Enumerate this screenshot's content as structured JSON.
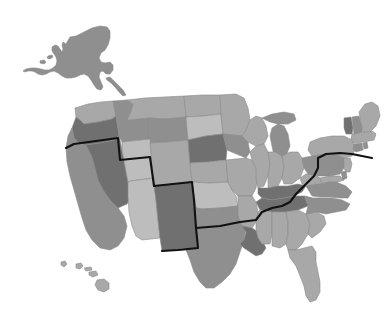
{
  "figure": {
    "type": "map",
    "title": "",
    "subtitle": "",
    "background_color": "#ffffff",
    "projection_note": "Albers USA with Alaska inset upper-left and Hawaii inset lower-left",
    "state_border_color": "#8a8a8a",
    "region_divider_color": "#111111",
    "region_divider_label": ""
  },
  "legend": {
    "visible": false,
    "position": "none",
    "entries": []
  },
  "palette": {
    "level_1": "#cfcfcf",
    "level_2": "#bdbdbd",
    "level_3": "#a8a8a8",
    "level_4": "#8f8f8f",
    "level_5": "#707070",
    "water": "#ffffff"
  },
  "chart_data": {
    "type": "heatmap",
    "title": "",
    "subtitle": "",
    "xlabel": "",
    "ylabel": "",
    "legend_position": "none",
    "grid": false,
    "value_scale": "grayscale",
    "value_levels": [
      1,
      2,
      3,
      4,
      5
    ],
    "level_colors": [
      "#cfcfcf",
      "#bdbdbd",
      "#a8a8a8",
      "#8f8f8f",
      "#707070"
    ],
    "categories": [
      "Alaska",
      "Hawaii",
      "Washington",
      "Oregon",
      "California",
      "Nevada",
      "Idaho",
      "Montana",
      "Wyoming",
      "Utah",
      "Colorado",
      "Arizona",
      "New Mexico",
      "North Dakota",
      "South Dakota",
      "Nebraska",
      "Kansas",
      "Oklahoma",
      "Texas",
      "Minnesota",
      "Iowa",
      "Missouri",
      "Arkansas",
      "Louisiana",
      "Wisconsin",
      "Illinois",
      "Michigan",
      "Indiana",
      "Ohio",
      "Kentucky",
      "Tennessee",
      "Mississippi",
      "Alabama",
      "Georgia",
      "Florida",
      "South Carolina",
      "North Carolina",
      "Virginia",
      "West Virginia",
      "Maryland",
      "Delaware",
      "Pennsylvania",
      "New Jersey",
      "New York",
      "Connecticut",
      "Rhode Island",
      "Massachusetts",
      "Vermont",
      "New Hampshire",
      "Maine"
    ],
    "values": [
      4,
      3,
      3,
      5,
      4,
      5,
      4,
      3,
      4,
      2,
      3,
      2,
      5,
      3,
      2,
      5,
      3,
      2,
      4,
      3,
      4,
      3,
      3,
      5,
      3,
      3,
      4,
      3,
      3,
      5,
      5,
      3,
      3,
      3,
      3,
      3,
      4,
      4,
      3,
      3,
      4,
      4,
      3,
      3,
      4,
      4,
      3,
      5,
      4,
      3
    ]
  },
  "states": [
    {
      "name": "Alaska",
      "abbr": "AK",
      "value": 4,
      "color": "#8f8f8f",
      "d": "M66 44 L70 37 L76 36 L84 32 L92 28 L100 26 L107 27 L110 31 L110 38 L108 45 L105 50 L101 53 L99 58 L101 62 L105 63 L110 62 L113 65 L113 70 L110 74 L106 74 L103 71 L100 72 L99 77 L101 82 L103 87 L101 90 L97 89 L94 85 L91 80 L88 76 L84 74 L80 75 L76 77 L71 78 L66 78 L62 76 L58 73 L54 71 L50 72 L46 74 L42 75 L38 74 L35 72 L32 71 L28 71 L25 72 L23 71 L26 69 L31 68 L36 68 L41 69 L45 70 L49 70 L53 68 L56 65 L57 61 L56 57 L54 54 L52 51 L52 47 L55 45 L58 46 L60 49 L62 52 L63 49 L62 45 L63 42 Z"
    },
    {
      "name": "Alaska-islet-1",
      "abbr": "AK",
      "value": 4,
      "color": "#8f8f8f",
      "d": "M40 61 L44 60 L46 62 L44 64 L40 63 Z"
    },
    {
      "name": "Alaska-islet-2",
      "abbr": "AK",
      "value": 4,
      "color": "#8f8f8f",
      "d": "M48 56 L52 55 L53 57 L50 59 L47 58 Z"
    },
    {
      "name": "Alaska-islet-3",
      "abbr": "AK",
      "value": 4,
      "color": "#8f8f8f",
      "d": "M55 51 L59 50 L61 52 L58 54 L55 53 Z"
    },
    {
      "name": "Alaska-tail",
      "abbr": "AK",
      "value": 4,
      "color": "#8f8f8f",
      "d": "M106 78 L110 77 L114 81 L119 86 L123 90 L126 95 L123 96 L119 92 L115 87 L111 83 L107 80 Z"
    },
    {
      "name": "Hawaii-kauai",
      "abbr": "HI",
      "value": 3,
      "color": "#a8a8a8",
      "d": "M61 262 L65 261 L67 264 L64 267 L61 265 Z"
    },
    {
      "name": "Hawaii-oahu",
      "abbr": "HI",
      "value": 3,
      "color": "#a8a8a8",
      "d": "M76 264 L81 263 L83 266 L80 269 L76 268 Z"
    },
    {
      "name": "Hawaii-molokai",
      "abbr": "HI",
      "value": 3,
      "color": "#a8a8a8",
      "d": "M84 268 L91 267 L92 270 L86 271 Z"
    },
    {
      "name": "Hawaii-maui",
      "abbr": "HI",
      "value": 3,
      "color": "#a8a8a8",
      "d": "M89 272 L96 271 L98 275 L93 277 L89 275 Z"
    },
    {
      "name": "Hawaii-bigisland",
      "abbr": "HI",
      "value": 3,
      "color": "#a8a8a8",
      "d": "M97 280 L104 279 L109 283 L109 289 L104 292 L98 290 L95 285 Z"
    },
    {
      "name": "Washington",
      "abbr": "WA",
      "value": 3,
      "color": "#a8a8a8",
      "d": "M75 108 L88 104 L101 102 L113 101 L116 116 L112 119 L98 122 L84 124 L80 120 L76 117 Z"
    },
    {
      "name": "Oregon",
      "abbr": "OR",
      "value": 5,
      "color": "#707070",
      "d": "M76 117 L80 120 L84 124 L98 122 L112 119 L116 116 L119 135 L115 140 L100 143 L86 145 L80 144 L74 138 L72 128 Z"
    },
    {
      "name": "California",
      "abbr": "CA",
      "value": 4,
      "color": "#8f8f8f",
      "d": "M72 128 L74 138 L80 144 L86 145 L92 157 L95 168 L98 180 L103 190 L110 200 L118 208 L124 216 L127 226 L124 238 L118 246 L110 250 L100 248 L92 240 L86 230 L82 218 L78 204 L74 190 L70 176 L67 162 L66 148 L68 136 Z"
    },
    {
      "name": "Nevada",
      "abbr": "NV",
      "value": 5,
      "color": "#707070",
      "d": "M86 145 L100 143 L115 140 L119 135 L122 150 L125 166 L128 182 L131 197 L127 204 L118 208 L110 200 L103 190 L98 180 L95 168 L92 157 Z"
    },
    {
      "name": "Idaho",
      "abbr": "ID",
      "value": 4,
      "color": "#8f8f8f",
      "d": "M113 101 L127 100 L133 104 L131 112 L127 120 L124 130 L122 140 L119 135 L116 116 Z"
    },
    {
      "name": "Idaho-south",
      "abbr": "ID",
      "value": 4,
      "color": "#8f8f8f",
      "d": "M119 135 L122 140 L124 130 L127 120 L148 118 L150 139 L122 142 Z"
    },
    {
      "name": "Montana",
      "abbr": "MT",
      "value": 3,
      "color": "#a8a8a8",
      "d": "M127 100 L145 98 L164 97 L184 96 L186 117 L166 119 L148 118 L127 120 L131 112 L133 104 Z"
    },
    {
      "name": "Wyoming",
      "abbr": "WY",
      "value": 4,
      "color": "#8f8f8f",
      "d": "M148 118 L166 119 L186 117 L188 140 L168 142 L150 143 L148 137 Z"
    },
    {
      "name": "Utah",
      "abbr": "UT",
      "value": 2,
      "color": "#bdbdbd",
      "d": "M122 142 L150 139 L152 160 L154 178 L138 180 L131 181 L128 182 L125 166 L122 150 Z"
    },
    {
      "name": "Colorado",
      "abbr": "CO",
      "value": 3,
      "color": "#a8a8a8",
      "d": "M150 143 L168 142 L188 140 L190 163 L192 182 L172 184 L154 186 L152 164 Z"
    },
    {
      "name": "Arizona",
      "abbr": "AZ",
      "value": 2,
      "color": "#bdbdbd",
      "d": "M128 182 L131 181 L138 180 L154 178 L156 200 L158 220 L160 238 L142 240 L136 236 L132 226 L129 212 L128 197 Z"
    },
    {
      "name": "New Mexico",
      "abbr": "NM",
      "value": 5,
      "color": "#707070",
      "d": "M154 186 L172 184 L192 182 L194 206 L196 228 L198 248 L178 250 L162 251 L160 238 L158 220 L156 200 Z"
    },
    {
      "name": "North Dakota",
      "abbr": "ND",
      "value": 3,
      "color": "#a8a8a8",
      "d": "M184 96 L202 95 L220 95 L221 114 L203 116 L186 117 Z"
    },
    {
      "name": "South Dakota",
      "abbr": "SD",
      "value": 2,
      "color": "#bdbdbd",
      "d": "M186 117 L203 116 L221 114 L223 134 L206 136 L188 140 Z"
    },
    {
      "name": "Nebraska",
      "abbr": "NE",
      "value": 5,
      "color": "#707070",
      "d": "M188 140 L206 136 L223 134 L227 150 L226 160 L208 162 L190 163 Z"
    },
    {
      "name": "Kansas",
      "abbr": "KS",
      "value": 3,
      "color": "#a8a8a8",
      "d": "M190 163 L208 162 L226 160 L228 182 L210 183 L192 182 Z"
    },
    {
      "name": "Oklahoma",
      "abbr": "OK",
      "value": 2,
      "color": "#bdbdbd",
      "d": "M192 182 L210 183 L228 182 L232 190 L236 196 L238 206 L220 208 L202 209 L196 208 L194 196 Z"
    },
    {
      "name": "Texas",
      "abbr": "TX",
      "value": 4,
      "color": "#8f8f8f",
      "d": "M196 208 L202 209 L220 208 L238 206 L242 216 L246 228 L244 240 L240 252 L236 264 L230 274 L222 282 L214 288 L206 288 L200 282 L194 272 L190 260 L186 250 L182 248 L178 250 L198 248 Z"
    },
    {
      "name": "Texas-fill",
      "abbr": "TX",
      "value": 4,
      "color": "#8f8f8f",
      "d": "M196 208 L194 196 L192 182 L198 248 L178 250 L198 249 Z"
    },
    {
      "name": "Minnesota",
      "abbr": "MN",
      "value": 3,
      "color": "#a8a8a8",
      "d": "M220 95 L236 94 L244 98 L248 108 L250 120 L246 130 L242 136 L223 134 L221 114 Z"
    },
    {
      "name": "Iowa",
      "abbr": "IA",
      "value": 4,
      "color": "#8f8f8f",
      "d": "M223 134 L242 136 L248 142 L250 152 L246 158 L227 150 Z"
    },
    {
      "name": "Missouri",
      "abbr": "MO",
      "value": 3,
      "color": "#a8a8a8",
      "d": "M226 160 L246 158 L252 160 L256 168 L258 178 L256 188 L252 196 L238 196 L232 190 L228 182 Z"
    },
    {
      "name": "Arkansas",
      "abbr": "AR",
      "value": 3,
      "color": "#a8a8a8",
      "d": "M238 196 L252 196 L256 202 L258 212 L256 222 L252 228 L242 226 L238 216 L238 206 Z"
    },
    {
      "name": "Louisiana",
      "abbr": "LA",
      "value": 5,
      "color": "#707070",
      "d": "M242 226 L252 228 L258 232 L262 240 L266 248 L262 254 L256 256 L250 252 L244 248 L240 244 L244 240 L246 232 Z"
    },
    {
      "name": "Wisconsin",
      "abbr": "WI",
      "value": 3,
      "color": "#a8a8a8",
      "d": "M246 130 L250 120 L256 116 L262 118 L266 126 L268 136 L264 144 L256 146 L248 142 L242 136 Z"
    },
    {
      "name": "Illinois",
      "abbr": "IL",
      "value": 3,
      "color": "#a8a8a8",
      "d": "M250 152 L256 146 L264 144 L268 152 L270 164 L268 176 L264 186 L258 188 L256 178 L256 168 L252 160 Z"
    },
    {
      "name": "Michigan-lower",
      "abbr": "MI",
      "value": 4,
      "color": "#8f8f8f",
      "d": "M272 128 L278 124 L284 126 L288 134 L290 146 L286 156 L280 160 L274 156 L272 146 L270 136 Z"
    },
    {
      "name": "Michigan-upper",
      "abbr": "MI",
      "value": 4,
      "color": "#8f8f8f",
      "d": "M262 118 L272 114 L284 112 L294 114 L296 120 L288 124 L278 124 L270 122 Z"
    },
    {
      "name": "Indiana",
      "abbr": "IN",
      "value": 3,
      "color": "#a8a8a8",
      "d": "M268 152 L276 152 L282 156 L284 166 L282 178 L278 186 L268 188 L268 176 L270 164 Z"
    },
    {
      "name": "Ohio",
      "abbr": "OH",
      "value": 3,
      "color": "#a8a8a8",
      "d": "M282 156 L290 152 L298 152 L302 158 L304 168 L300 178 L292 184 L284 184 L282 178 L284 166 Z"
    },
    {
      "name": "Kentucky",
      "abbr": "KY",
      "value": 5,
      "color": "#707070",
      "d": "M258 188 L268 188 L278 186 L288 186 L298 184 L306 186 L302 192 L294 196 L284 198 L272 200 L262 198 L258 194 Z"
    },
    {
      "name": "Tennessee",
      "abbr": "TN",
      "value": 5,
      "color": "#707070",
      "d": "M256 202 L262 198 L272 200 L284 198 L294 196 L304 196 L312 198 L308 206 L298 210 L286 212 L272 212 L260 210 Z"
    },
    {
      "name": "Mississippi",
      "abbr": "MS",
      "value": 3,
      "color": "#a8a8a8",
      "d": "M256 222 L258 212 L260 210 L272 212 L272 222 L272 234 L270 244 L262 244 L258 238 L256 230 Z"
    },
    {
      "name": "Alabama",
      "abbr": "AL",
      "value": 3,
      "color": "#a8a8a8",
      "d": "M272 212 L286 212 L288 222 L288 234 L286 244 L280 248 L272 246 L272 234 L272 222 Z"
    },
    {
      "name": "Georgia",
      "abbr": "GA",
      "value": 3,
      "color": "#a8a8a8",
      "d": "M286 212 L298 210 L306 214 L310 224 L308 234 L302 244 L296 250 L288 250 L286 244 L288 234 L288 222 Z"
    },
    {
      "name": "Florida",
      "abbr": "FL",
      "value": 3,
      "color": "#a8a8a8",
      "d": "M288 250 L296 250 L304 248 L312 246 L316 252 L316 262 L318 272 L320 282 L320 292 L316 300 L310 302 L306 296 L304 286 L300 276 L296 266 L290 258 Z"
    },
    {
      "name": "South Carolina",
      "abbr": "SC",
      "value": 3,
      "color": "#a8a8a8",
      "d": "M306 214 L316 212 L324 216 L326 224 L320 232 L312 238 L308 234 L310 224 Z"
    },
    {
      "name": "North Carolina",
      "abbr": "NC",
      "value": 4,
      "color": "#8f8f8f",
      "d": "M304 196 L312 198 L322 198 L332 198 L342 200 L350 204 L346 210 L336 212 L326 214 L316 212 L306 214 L308 206 Z"
    },
    {
      "name": "Virginia",
      "abbr": "VA",
      "value": 4,
      "color": "#8f8f8f",
      "d": "M306 186 L316 184 L326 182 L336 182 L346 186 L352 192 L348 198 L340 198 L330 197 L320 197 L312 196 Z"
    },
    {
      "name": "West Virginia",
      "abbr": "WV",
      "value": 3,
      "color": "#a8a8a8",
      "d": "M300 178 L306 174 L314 174 L320 178 L322 184 L316 184 L306 186 L302 184 Z"
    },
    {
      "name": "Maryland",
      "abbr": "MD",
      "value": 3,
      "color": "#a8a8a8",
      "d": "M320 178 L330 176 L340 176 L344 180 L338 182 L328 182 L322 184 Z"
    },
    {
      "name": "Delaware",
      "abbr": "DE",
      "value": 4,
      "color": "#8f8f8f",
      "d": "M341 172 L346 171 L347 178 L343 180 Z"
    },
    {
      "name": "Pennsylvania",
      "abbr": "PA",
      "value": 4,
      "color": "#8f8f8f",
      "d": "M302 158 L312 156 L324 154 L336 154 L344 158 L344 168 L340 174 L330 176 L318 176 L308 174 L304 168 Z"
    },
    {
      "name": "New Jersey",
      "abbr": "NJ",
      "value": 3,
      "color": "#a8a8a8",
      "d": "M344 158 L350 158 L352 164 L350 172 L346 172 L344 168 Z"
    },
    {
      "name": "New York",
      "abbr": "NY",
      "value": 3,
      "color": "#a8a8a8",
      "d": "M310 142 L320 138 L332 136 L344 136 L352 140 L356 148 L352 156 L344 158 L336 154 L324 154 L312 156 L308 150 Z"
    },
    {
      "name": "Connecticut",
      "abbr": "CT",
      "value": 4,
      "color": "#8f8f8f",
      "d": "M354 144 L362 143 L363 150 L356 152 L353 149 Z"
    },
    {
      "name": "Rhode Island",
      "abbr": "RI",
      "value": 4,
      "color": "#8f8f8f",
      "d": "M363 143 L367 142 L368 148 L364 149 Z"
    },
    {
      "name": "Massachusetts",
      "abbr": "MA",
      "value": 3,
      "color": "#a8a8a8",
      "d": "M352 134 L362 132 L372 131 L376 134 L374 140 L364 142 L354 143 L351 139 Z"
    },
    {
      "name": "Vermont",
      "abbr": "VT",
      "value": 5,
      "color": "#707070",
      "d": "M344 118 L351 117 L353 128 L352 134 L346 134 L344 128 Z"
    },
    {
      "name": "New Hampshire",
      "abbr": "NH",
      "value": 4,
      "color": "#8f8f8f",
      "d": "M352 117 L359 116 L362 126 L362 132 L354 134 L353 126 Z"
    },
    {
      "name": "Maine",
      "abbr": "ME",
      "value": 3,
      "color": "#a8a8a8",
      "d": "M359 112 L365 104 L372 102 L378 106 L380 116 L376 126 L370 132 L363 132 L361 122 Z"
    }
  ],
  "region_divider": {
    "name": "bold-region-boundary",
    "d": "M66 148 L74 144 L96 141 L118 138 L120 160 L150 157 L154 186 L192 182 L194 200 L196 228 L198 248 L178 250 L162 251 M196 228 L220 226 L240 222 L256 220 L262 212 L272 208 L282 206 L290 202 L296 194 L302 188 L308 182 L314 176 L318 168 L318 158 L326 154 L340 153 L352 154 L362 156 L372 158"
  }
}
